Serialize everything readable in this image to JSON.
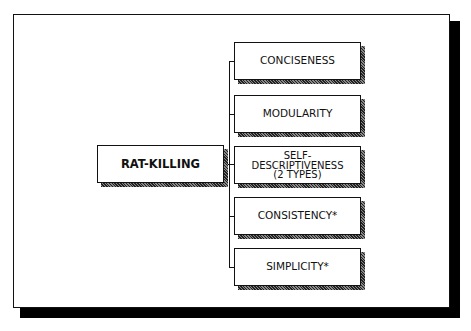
{
  "diagram": {
    "root": {
      "label": "RAT-KILLING"
    },
    "children": [
      {
        "label": "CONCISENESS"
      },
      {
        "label": "MODULARITY"
      },
      {
        "label_lines": [
          "SELF-",
          "DESCRIPTIVENESS",
          "(2 TYPES)"
        ]
      },
      {
        "label": "CONSISTENCY*"
      },
      {
        "label": "SIMPLICITY*"
      }
    ],
    "colors": {
      "line": "#111111",
      "background": "#ffffff",
      "shadow": "#000000"
    }
  }
}
